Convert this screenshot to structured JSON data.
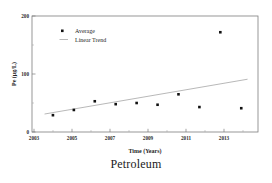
{
  "figure": {
    "caption": "Petroleum"
  },
  "chart_data": {
    "type": "scatter",
    "title": "",
    "caption": "Petroleum",
    "xlabel": "Time (Years)",
    "ylabel": "Pe (µg/L)",
    "xlim": [
      2003,
      2013.8
    ],
    "ylim": [
      0,
      200
    ],
    "xticks": [
      "2003",
      "2005",
      "2007",
      "2009",
      "2011",
      "2013"
    ],
    "xtick_values": [
      2003,
      2005,
      2007,
      2009,
      2011,
      2013
    ],
    "yticks": [
      "0",
      "100",
      "200"
    ],
    "ytick_values": [
      0,
      100,
      200
    ],
    "grid": false,
    "legend_position": "top-left",
    "legend": [
      {
        "label": "Average",
        "marker": "square",
        "color": "#1a1a1a"
      },
      {
        "label": "Linear Trend",
        "marker": "line",
        "color": "#9a9a9a"
      }
    ],
    "series": [
      {
        "name": "Average",
        "type": "scatter",
        "marker": "square",
        "color": "#1a1a1a",
        "x": [
          2004,
          2005,
          2006,
          2007,
          2008,
          2009,
          2010,
          2011,
          2012,
          2013
        ],
        "values": [
          29,
          38,
          53,
          48,
          50,
          47,
          65,
          43,
          172,
          41
        ]
      },
      {
        "name": "Linear Trend",
        "type": "line",
        "color": "#a8a8a8",
        "x": [
          2003.6,
          2013.3
        ],
        "values": [
          31,
          91
        ]
      }
    ]
  }
}
